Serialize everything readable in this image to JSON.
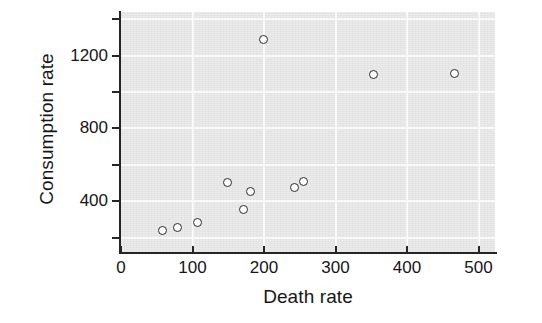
{
  "chart_data": {
    "type": "scatter",
    "title": "",
    "xlabel": "Death rate",
    "ylabel": "Consumption rate",
    "xlim": [
      0,
      523
    ],
    "ylim": [
      115,
      1440
    ],
    "grid": true,
    "legend": "none",
    "x_ticks": [
      0,
      100,
      200,
      300,
      400,
      500
    ],
    "x_tick_labels": [
      "0",
      "100",
      "200",
      "300",
      "400",
      "500"
    ],
    "y_ticks": [
      200,
      400,
      600,
      800,
      1000,
      1200,
      1400
    ],
    "y_tick_labels": [
      "",
      "400",
      "",
      "800",
      "",
      "1200",
      ""
    ],
    "y_labeled_ticks": [
      400,
      800,
      1200
    ],
    "points": [
      {
        "x": 58,
        "y": 240
      },
      {
        "x": 79,
        "y": 255
      },
      {
        "x": 107,
        "y": 285
      },
      {
        "x": 149,
        "y": 500
      },
      {
        "x": 172,
        "y": 355
      },
      {
        "x": 181,
        "y": 455
      },
      {
        "x": 199,
        "y": 1290
      },
      {
        "x": 243,
        "y": 475
      },
      {
        "x": 255,
        "y": 510
      },
      {
        "x": 353,
        "y": 1095
      },
      {
        "x": 467,
        "y": 1100
      }
    ],
    "colors": {
      "panel_background": "#e6e6e6",
      "gridline": "#fafafa",
      "axis": "#262626",
      "marker_edge": "#2a2a2a",
      "marker_fill": "#fdfdfd",
      "text": "#161616",
      "figure_background": "#ffffff"
    }
  }
}
